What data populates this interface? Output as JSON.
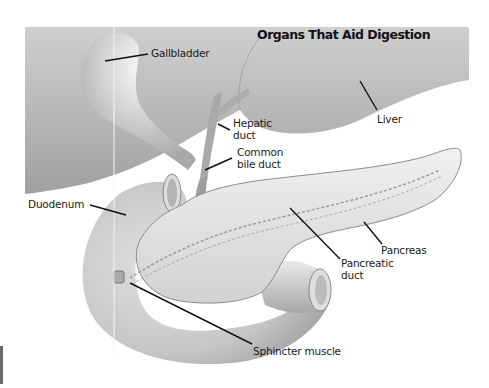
{
  "title": "Organs That Aid Digestion",
  "labels": {
    "gallbladder": "Gallbladder",
    "liver": "Liver",
    "hepatic_duct_1": "Hepatic",
    "hepatic_duct_2": "duct",
    "common_bile_duct_1": "Common",
    "common_bile_duct_2": "bile duct",
    "duodenum": "Duodenum",
    "pancreas": "Pancreas",
    "pancreatic_duct_1": "Pancreatic",
    "pancreatic_duct_2": "duct",
    "sphincter_muscle": "Sphincter muscle"
  },
  "colors": {
    "background": "#ffffff",
    "organ_light": "#e6e6e6",
    "organ_mid": "#bdbdbd",
    "organ_dark": "#8f8f8f",
    "leader_line": "#111111"
  }
}
